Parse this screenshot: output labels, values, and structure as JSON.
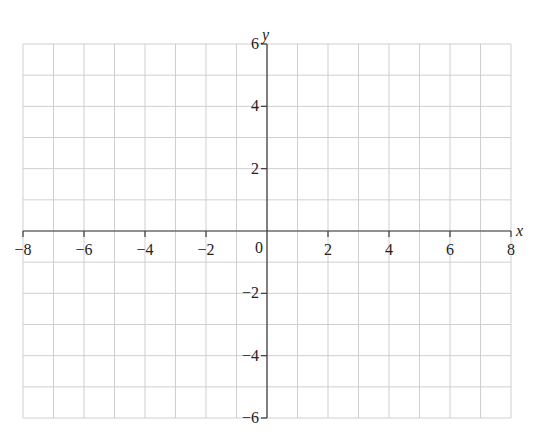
{
  "chart_data": {
    "type": "scatter",
    "title": "",
    "xlabel": "x",
    "ylabel": "y",
    "xlim": [
      -8,
      8
    ],
    "ylim": [
      -6,
      6
    ],
    "grid": true,
    "grid_step": 1,
    "x_ticks": [
      -8,
      -6,
      -4,
      -2,
      0,
      2,
      4,
      6,
      8
    ],
    "x_tick_labels": [
      "−8",
      "−6",
      "−4",
      "−2",
      "0",
      "2",
      "4",
      "6",
      "8"
    ],
    "y_ticks": [
      -6,
      -4,
      -2,
      2,
      4,
      6
    ],
    "y_tick_labels": [
      "−6",
      "−4",
      "−2",
      "2",
      "4",
      "6"
    ],
    "origin_label": "0",
    "series": [],
    "legend": null
  },
  "layout": {
    "x_min_px": 23,
    "x_max_px": 511,
    "y_top_px": 44,
    "y_bottom_px": 418
  },
  "colors": {
    "grid": "#cfcfcf",
    "axis": "#3a3a3a",
    "text": "#222222"
  }
}
